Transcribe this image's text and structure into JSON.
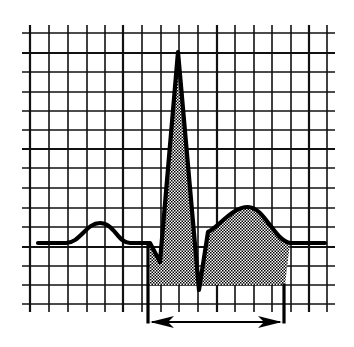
{
  "figure": {
    "title": "ECG waveform on grid with shaded QRS-T region and interval bracket",
    "colors": {
      "background": "#ffffff",
      "grid": "#111111",
      "trace": "#000000",
      "shade_dark": "#000000",
      "shade_light": "#ffffff"
    },
    "grid": {
      "vertical_lines_x": [
        30,
        49,
        68,
        87,
        105,
        123,
        142,
        161,
        179,
        198,
        217,
        235,
        254,
        272,
        291,
        309,
        327
      ],
      "horizontal_lines_y": [
        33,
        53,
        72,
        92,
        111,
        130,
        149,
        168,
        188,
        208,
        227,
        247,
        266,
        285,
        304
      ],
      "major_vertical_x": [
        30,
        123,
        217,
        309
      ],
      "major_horizontal_y": [
        53,
        149,
        247
      ],
      "x_extent": [
        22,
        335
      ],
      "y_extent": [
        25,
        312
      ]
    },
    "waveform": {
      "baseline_y": 243,
      "segments": [
        "P wave",
        "PR segment",
        "QRS complex",
        "ST segment",
        "T wave"
      ],
      "points": {
        "start": [
          38,
          243
        ],
        "p_onset": [
          66,
          243
        ],
        "p_peak": [
          100,
          223
        ],
        "p_offset": [
          130,
          243
        ],
        "q_onset": [
          150,
          243
        ],
        "q_nadir": [
          160,
          262
        ],
        "r_peak": [
          178,
          52
        ],
        "s_nadir": [
          199,
          290
        ],
        "st_junction": [
          208,
          232
        ],
        "t_peak": [
          248,
          207
        ],
        "t_offset": [
          290,
          243
        ],
        "end": [
          325,
          243
        ]
      }
    },
    "shaded_region": {
      "pattern": "checkered",
      "x_range": [
        150,
        285
      ],
      "bottom_y": 285,
      "description": "Area between QRS-T trace and lower boundary"
    },
    "interval_bracket": {
      "left_x": 148,
      "right_x": 284,
      "bottom_y": 322,
      "arrow": "double-headed",
      "label": ""
    }
  }
}
